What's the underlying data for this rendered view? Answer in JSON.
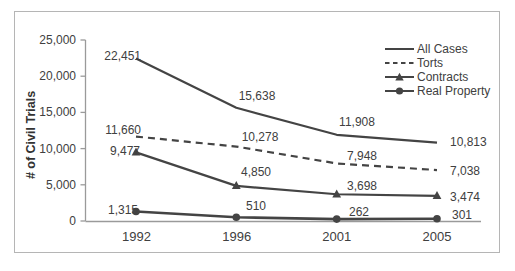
{
  "chart_data": {
    "type": "line",
    "title": "",
    "xlabel": "",
    "ylabel": "# of Civil Trials",
    "categories": [
      "1992",
      "1996",
      "2001",
      "2005"
    ],
    "series": [
      {
        "name": "All Cases",
        "line_style": "solid",
        "marker": "none",
        "values": [
          22451,
          15638,
          11908,
          10813
        ],
        "labels": [
          "22,451",
          "15,638",
          "11,908",
          "10,813"
        ]
      },
      {
        "name": "Torts",
        "line_style": "dashed",
        "marker": "none",
        "values": [
          11660,
          10278,
          7948,
          7038
        ],
        "labels": [
          "11,660",
          "10,278",
          "7,948",
          "7,038"
        ]
      },
      {
        "name": "Contracts",
        "line_style": "solid",
        "marker": "triangle",
        "values": [
          9477,
          4850,
          3698,
          3474
        ],
        "labels": [
          "9,477",
          "4,850",
          "3,698",
          "3,474"
        ]
      },
      {
        "name": "Real Property",
        "line_style": "solid",
        "marker": "circle",
        "values": [
          1315,
          510,
          262,
          301
        ],
        "labels": [
          "1,315",
          "510",
          "262",
          "301"
        ]
      }
    ],
    "ylim": [
      0,
      25000
    ],
    "y_tick_labels": [
      "0",
      "5,000",
      "10,000",
      "15,000",
      "20,000",
      "25,000"
    ],
    "grid": false,
    "legend_position": "top-right",
    "colors": {
      "line": "#444444",
      "text": "#404040",
      "axis": "#9a9a9a",
      "frame": "#b5b5b5"
    }
  }
}
